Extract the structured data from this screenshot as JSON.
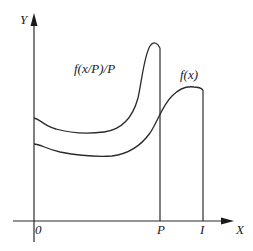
{
  "diagram": {
    "axes": {
      "y_label": "Y",
      "x_label": "X",
      "origin_label": "0"
    },
    "markers": {
      "p_label": "P",
      "i_label": "I"
    },
    "curves": {
      "scaled_label": "f(x/P)/P",
      "original_label": "f(x)"
    }
  },
  "colors": {
    "ink": "#2a2a2a",
    "background": "#ffffff"
  }
}
